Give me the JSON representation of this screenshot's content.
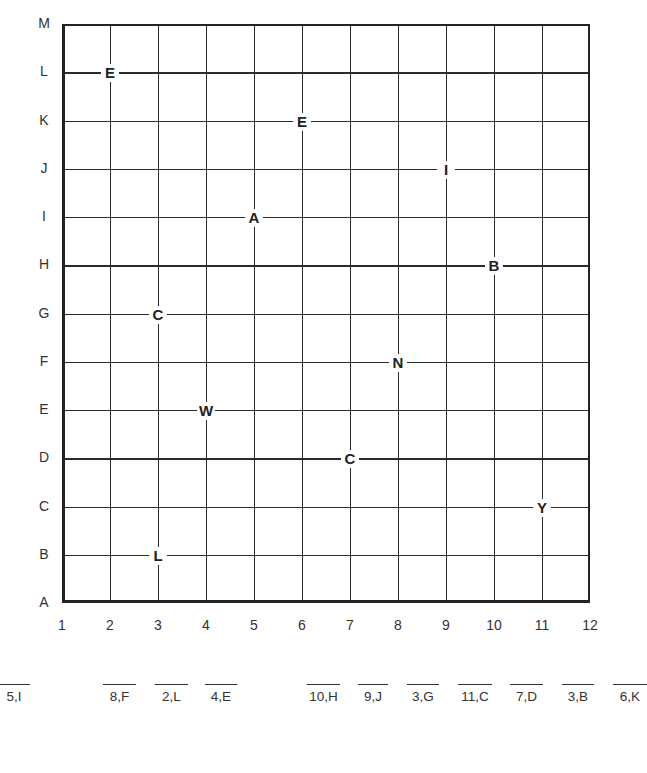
{
  "grid": {
    "x_labels": [
      "1",
      "2",
      "3",
      "4",
      "5",
      "6",
      "7",
      "8",
      "9",
      "10",
      "11",
      "12"
    ],
    "y_labels": [
      "A",
      "B",
      "C",
      "D",
      "E",
      "F",
      "G",
      "H",
      "I",
      "J",
      "K",
      "L",
      "M"
    ]
  },
  "points": [
    {
      "letter": "E",
      "x": 2,
      "y": "L"
    },
    {
      "letter": "E",
      "x": 6,
      "y": "K"
    },
    {
      "letter": "I",
      "x": 9,
      "y": "J"
    },
    {
      "letter": "A",
      "x": 5,
      "y": "I"
    },
    {
      "letter": "B",
      "x": 10,
      "y": "H"
    },
    {
      "letter": "C",
      "x": 3,
      "y": "G"
    },
    {
      "letter": "N",
      "x": 8,
      "y": "F"
    },
    {
      "letter": "W",
      "x": 4,
      "y": "E"
    },
    {
      "letter": "C",
      "x": 7,
      "y": "D"
    },
    {
      "letter": "Y",
      "x": 11,
      "y": "C"
    },
    {
      "letter": "L",
      "x": 3,
      "y": "B"
    }
  ],
  "answer_blanks": [
    {
      "label": "5,I",
      "left": -2,
      "width": 32
    },
    {
      "label": "8,F",
      "left": 103,
      "width": 33
    },
    {
      "label": "2,L",
      "left": 155,
      "width": 33
    },
    {
      "label": "4,E",
      "left": 205,
      "width": 32
    },
    {
      "label": "10,H",
      "left": 307,
      "width": 33
    },
    {
      "label": "9,J",
      "left": 358,
      "width": 30
    },
    {
      "label": "3,G",
      "left": 407,
      "width": 32
    },
    {
      "label": "11,C",
      "left": 458,
      "width": 34
    },
    {
      "label": "7,D",
      "left": 510,
      "width": 33
    },
    {
      "label": "3,B",
      "left": 562,
      "width": 32
    },
    {
      "label": "6,K",
      "left": 613,
      "width": 34
    }
  ]
}
